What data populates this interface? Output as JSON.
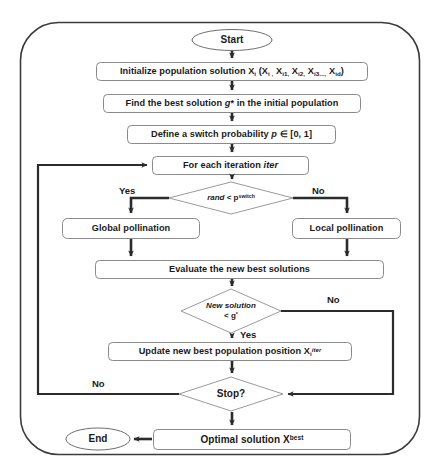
{
  "diagram": {
    "frame_color": "#3c3c3c",
    "node_stroke": "#6e6e6e",
    "arrow_color": "#2b2b2b",
    "background": "#ffffff"
  },
  "nodes": {
    "start": {
      "label": "Start",
      "shape": "ellipse"
    },
    "initialize": {
      "label": "Initialize population solution X",
      "sub1": "i",
      "paren_open": " (X",
      "sub2": "i ,",
      "t2": " X",
      "sub3": "i1,",
      "t3": " X",
      "sub4": "i2,",
      "t4": " X",
      "sub5": "i3...,",
      "t5": " X",
      "sub6": "id",
      "paren_close": ")",
      "shape": "process"
    },
    "find_best": {
      "label_a": "Find the best solution ",
      "label_g": "g",
      "label_star": "*",
      "label_b": " in the initial population",
      "shape": "process"
    },
    "define_switch": {
      "label_a": "Define a switch probability ",
      "label_p": "p",
      "label_b": " ∈ [0, 1]",
      "shape": "process"
    },
    "for_each": {
      "label_a": "For each iteration ",
      "label_b": "iter",
      "shape": "process"
    },
    "rand_decision": {
      "label_a": "rand",
      "label_b": " < p",
      "label_sup": "switch",
      "shape": "decision"
    },
    "global_pollination": {
      "label": "Global pollination",
      "shape": "process"
    },
    "local_pollination": {
      "label": "Local pollination",
      "shape": "process"
    },
    "evaluate": {
      "label": "Evaluate  the new best solutions",
      "shape": "process"
    },
    "new_solution_decision": {
      "line1": "New solution",
      "line2_a": "< g",
      "line2_sup": "*",
      "shape": "decision"
    },
    "update": {
      "label": "Update new best population position X",
      "sub": "i",
      "sup": "iter",
      "shape": "process"
    },
    "stop_decision": {
      "label": "Stop?",
      "shape": "decision"
    },
    "optimal": {
      "label": "Optimal solution X",
      "sup": "best",
      "shape": "process"
    },
    "end": {
      "label": "End",
      "shape": "ellipse"
    }
  },
  "edge_labels": {
    "rand_yes": "Yes",
    "rand_no": "No",
    "new_solution_no": "No",
    "new_solution_yes": "Yes",
    "stop_no": "No"
  }
}
